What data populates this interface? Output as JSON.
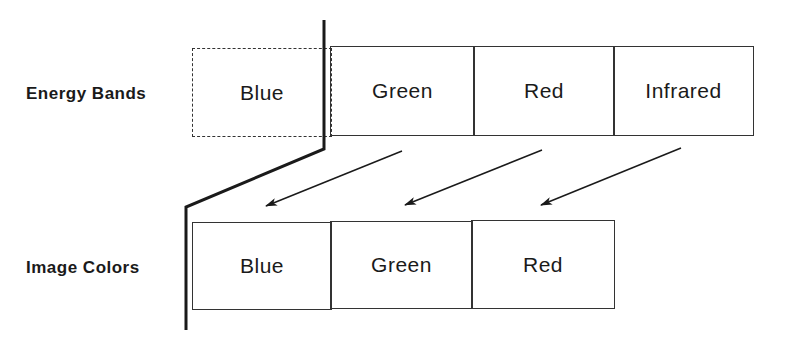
{
  "diagram": {
    "energy_bands": {
      "label": "Energy Bands",
      "cells": [
        "Blue",
        "Green",
        "Red",
        "Infrared"
      ]
    },
    "image_colors": {
      "label": "Image Colors",
      "cells": [
        "Blue",
        "Green",
        "Red"
      ]
    },
    "mappings": [
      {
        "from": "Green",
        "to": "Blue"
      },
      {
        "from": "Red",
        "to": "Green"
      },
      {
        "from": "Infrared",
        "to": "Red"
      }
    ],
    "colors": {
      "line": "#1a1a1a",
      "background": "#ffffff"
    }
  }
}
